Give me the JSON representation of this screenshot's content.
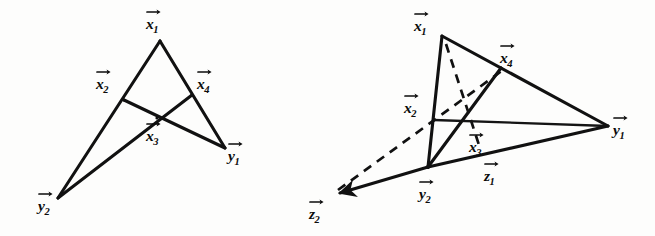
{
  "figure": {
    "background_color": "#fdfdfc",
    "ink_color": "#111111",
    "width": 655,
    "height": 236
  },
  "diagrams": [
    {
      "id": "left-diagram",
      "name": "left-configuration",
      "points": [
        {
          "id": "x1",
          "letter": "x",
          "subscript": "1",
          "vertex_x": 160,
          "vertex_y": 41,
          "label_x": 146,
          "label_y": 16
        },
        {
          "id": "x2",
          "letter": "x",
          "subscript": "2",
          "vertex_x": 124,
          "vertex_y": 100,
          "label_x": 96,
          "label_y": 76
        },
        {
          "id": "x4",
          "letter": "x",
          "subscript": "4",
          "vertex_x": 192,
          "vertex_y": 95,
          "label_x": 197,
          "label_y": 76
        },
        {
          "id": "x3",
          "letter": "x",
          "subscript": "3",
          "vertex_x": 157,
          "vertex_y": 118,
          "label_x": 146,
          "label_y": 124
        },
        {
          "id": "y1",
          "letter": "y",
          "subscript": "1",
          "vertex_x": 225,
          "vertex_y": 148,
          "label_x": 228,
          "label_y": 140
        },
        {
          "id": "y2",
          "letter": "y",
          "subscript": "2",
          "vertex_x": 58,
          "vertex_y": 198,
          "label_x": 38,
          "label_y": 190
        }
      ],
      "solid_edges": [
        {
          "from": "x1",
          "to": "y2",
          "name": "edge-x1-y2"
        },
        {
          "from": "x1",
          "to": "y1",
          "name": "edge-x1-y1"
        },
        {
          "from": "x2",
          "to": "y1",
          "name": "edge-x2-y1"
        },
        {
          "from": "x4",
          "to": "y2",
          "name": "edge-x4-y2"
        }
      ],
      "dashed_edges": []
    },
    {
      "id": "right-diagram",
      "name": "right-configuration",
      "points": [
        {
          "id": "x1",
          "letter": "x",
          "subscript": "1",
          "vertex_x": 442,
          "vertex_y": 36,
          "label_x": 414,
          "label_y": 12
        },
        {
          "id": "x4",
          "letter": "x",
          "subscript": "4",
          "vertex_x": 501,
          "vertex_y": 68,
          "label_x": 498,
          "label_y": 45
        },
        {
          "id": "x2",
          "letter": "x",
          "subscript": "2",
          "vertex_x": 434,
          "vertex_y": 120,
          "label_x": 402,
          "label_y": 95
        },
        {
          "id": "x3",
          "letter": "x",
          "subscript": "3",
          "vertex_x": 463,
          "vertex_y": 126,
          "label_x": 466,
          "label_y": 131
        },
        {
          "id": "y1",
          "letter": "y",
          "subscript": "1",
          "vertex_x": 608,
          "vertex_y": 126,
          "label_x": 611,
          "label_y": 110
        },
        {
          "id": "y2",
          "letter": "y",
          "subscript": "2",
          "vertex_x": 428,
          "vertex_y": 167,
          "label_x": 417,
          "label_y": 176
        },
        {
          "id": "z1",
          "letter": "z",
          "subscript": "1",
          "vertex_x": 497,
          "vertex_y": 153,
          "label_x": 481,
          "label_y": 157
        },
        {
          "id": "z2",
          "letter": "z",
          "subscript": "2",
          "vertex_x": 334,
          "vertex_y": 194,
          "label_x": 307,
          "label_y": 198
        }
      ],
      "solid_edges": [
        {
          "from": "x1",
          "to": "y2",
          "name": "edge-x1-y2"
        },
        {
          "from": "x1",
          "to": "y1",
          "name": "edge-x1-y1"
        },
        {
          "from": "x2",
          "to": "y1",
          "name": "edge-x2-y1"
        },
        {
          "from": "x4",
          "to": "y2",
          "name": "edge-x4-y2"
        },
        {
          "from": "y2",
          "to": "y1",
          "name": "edge-y2-y1"
        },
        {
          "from": "y2",
          "to": "z2",
          "name": "edge-y2-z2-arrow"
        }
      ],
      "dashed_edges": [
        {
          "from": "x1",
          "to": "x3",
          "name": "dashed-x1-z1"
        },
        {
          "from": "z2",
          "to": "x4",
          "name": "dashed-z2-x4"
        }
      ]
    }
  ],
  "labels": {
    "left": {
      "x1": "x",
      "x1_sub": "1",
      "x2": "x",
      "x2_sub": "2",
      "x3": "x",
      "x3_sub": "3",
      "x4": "x",
      "x4_sub": "4",
      "y1": "y",
      "y1_sub": "1",
      "y2": "y",
      "y2_sub": "2"
    },
    "right": {
      "x1": "x",
      "x1_sub": "1",
      "x2": "x",
      "x2_sub": "2",
      "x3": "x",
      "x3_sub": "3",
      "x4": "x",
      "x4_sub": "4",
      "y1": "y",
      "y1_sub": "1",
      "y2": "y",
      "y2_sub": "2",
      "z1": "z",
      "z1_sub": "1",
      "z2": "z",
      "z2_sub": "2"
    }
  }
}
